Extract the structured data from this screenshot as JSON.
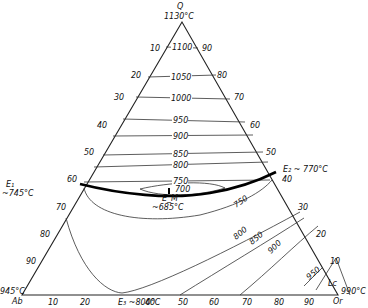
{
  "diagram": {
    "type": "ternary-phase-diagram",
    "vertices": {
      "top": {
        "name": "Q",
        "temp": "1130°C"
      },
      "left": {
        "name": "Ab",
        "temp": "945°C"
      },
      "right": {
        "name": "Or",
        "temp": "990°C"
      }
    },
    "eutectics": {
      "E1": {
        "label": "E₁",
        "temp": "~745°C"
      },
      "E2": {
        "label": "E₂ ~ 770°C"
      },
      "E3": {
        "label": "E₃ ~800°C"
      },
      "EM": {
        "label": "E_M",
        "temp": "~685°C"
      }
    },
    "field_label": "Lc",
    "left_ticks": [
      "10",
      "20",
      "30",
      "40",
      "50",
      "60",
      "70",
      "80",
      "90"
    ],
    "right_ticks": [
      "90",
      "80",
      "70",
      "60",
      "50",
      "40",
      "30",
      "20",
      "10"
    ],
    "bottom_ticks": [
      "10",
      "20",
      "30",
      "40",
      "50",
      "60",
      "70",
      "80",
      "90"
    ],
    "isotherms_upper": [
      "1100",
      "1050",
      "1000",
      "950",
      "900",
      "850",
      "800",
      "750",
      "700"
    ],
    "isotherms_lower": [
      "750",
      "800",
      "850",
      "900",
      "950"
    ]
  }
}
